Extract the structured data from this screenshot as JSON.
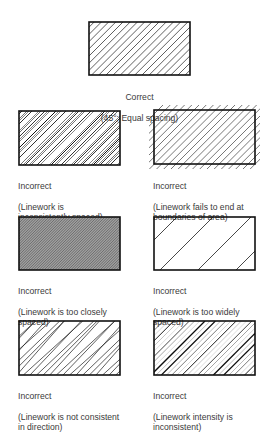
{
  "diagram": {
    "panels": [
      {
        "id": "correct",
        "caption_line1": "Correct",
        "caption_line2": "(45°; Equal spacing)",
        "verdict": "Correct"
      },
      {
        "id": "inconsistent-spacing",
        "caption_line1": "Incorrect",
        "caption_line2": "(Linework is\ninconsistently spaced)",
        "verdict": "Incorrect"
      },
      {
        "id": "fails-to-end",
        "caption_line1": "Incorrect",
        "caption_line2": "(Linework fails to end at\nboundaries of area)",
        "verdict": "Incorrect"
      },
      {
        "id": "too-close",
        "caption_line1": "Incorrect",
        "caption_line2": "(Linework is too closely\nspaced)",
        "verdict": "Incorrect"
      },
      {
        "id": "too-wide",
        "caption_line1": "Incorrect",
        "caption_line2": "(Linework is too widely\nspaced)",
        "verdict": "Incorrect"
      },
      {
        "id": "inconsistent-direction",
        "caption_line1": "Incorrect",
        "caption_line2": "(Linework is not consistent\nin direction)",
        "verdict": "Incorrect"
      },
      {
        "id": "inconsistent-intensity",
        "caption_line1": "Incorrect",
        "caption_line2": "(Linework intensity is\ninconsistent)",
        "verdict": "Incorrect"
      }
    ],
    "colors": {
      "line": "#1a1a1a",
      "border": "#111111",
      "text": "#3a3a3a"
    }
  }
}
